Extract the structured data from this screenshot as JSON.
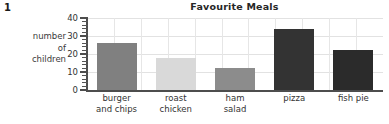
{
  "question_number": "1",
  "chart_data": {
    "type": "bar",
    "title": "Favourite Meals",
    "xlabel": "",
    "ylabel": "number of children",
    "ylabel_lines": [
      "number",
      "of",
      "children"
    ],
    "categories": [
      "burger and chips",
      "roast chicken",
      "ham salad",
      "pizza",
      "fish pie"
    ],
    "category_lines": [
      [
        "burger",
        "and chips"
      ],
      [
        "roast",
        "chicken"
      ],
      [
        "ham",
        "salad"
      ],
      [
        "pizza",
        ""
      ],
      [
        "fish pie",
        ""
      ]
    ],
    "values": [
      26,
      18,
      12,
      34,
      22
    ],
    "bar_colors": [
      "#808080",
      "#d9d9d9",
      "#8c8c8c",
      "#333333",
      "#2b2b2b"
    ],
    "ylim": [
      0,
      40
    ],
    "y_ticks": [
      0,
      10,
      20,
      30,
      40
    ],
    "y_tick_labels": [
      "0",
      "10",
      "20",
      "30",
      "40"
    ],
    "y_minor_tick_step": 2,
    "grid": true,
    "legend": "none"
  }
}
